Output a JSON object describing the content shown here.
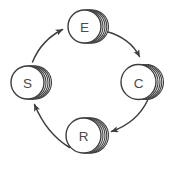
{
  "diagram": {
    "type": "cycle",
    "direction": "clockwise",
    "nodes": [
      {
        "id": "E",
        "label": "E",
        "position": "top",
        "style": "stacked-circle"
      },
      {
        "id": "C",
        "label": "C",
        "position": "right",
        "style": "stacked-circle"
      },
      {
        "id": "R",
        "label": "R",
        "position": "bottom",
        "style": "stacked-circle"
      },
      {
        "id": "S",
        "label": "S",
        "position": "left",
        "style": "stacked-circle"
      }
    ],
    "edges": [
      {
        "from": "S",
        "to": "E"
      },
      {
        "from": "E",
        "to": "C"
      },
      {
        "from": "C",
        "to": "R"
      },
      {
        "from": "R",
        "to": "S"
      }
    ],
    "colors": {
      "stroke": "#3e3e3e",
      "label": "#4a4a4a",
      "fill": "#ffffff",
      "background": "#ffffff"
    }
  }
}
